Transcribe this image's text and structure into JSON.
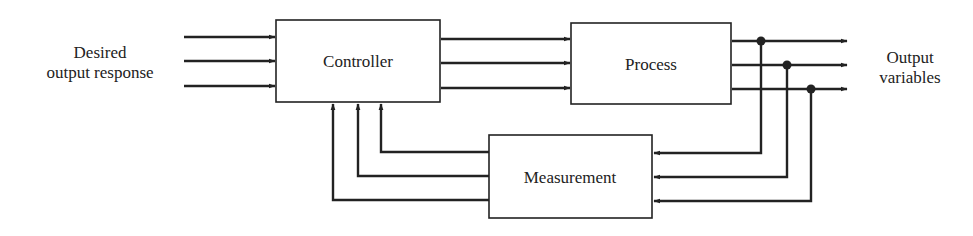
{
  "diagram": {
    "type": "block-diagram",
    "input_label": {
      "line1": "Desired",
      "line2": "output response"
    },
    "output_label": {
      "line1": "Output",
      "line2": "variables"
    },
    "blocks": [
      {
        "id": "controller",
        "label": "Controller"
      },
      {
        "id": "process",
        "label": "Process"
      },
      {
        "id": "measurement",
        "label": "Measurement"
      }
    ],
    "connections": [
      {
        "from": "input",
        "to": "controller",
        "count": 3
      },
      {
        "from": "controller",
        "to": "process",
        "count": 3
      },
      {
        "from": "process",
        "to": "output",
        "count": 3
      },
      {
        "from": "process-output-junctions",
        "to": "measurement",
        "count": 3
      },
      {
        "from": "measurement",
        "to": "controller",
        "count": 3
      }
    ],
    "colors": {
      "line": "#222222",
      "background": "#ffffff"
    }
  }
}
